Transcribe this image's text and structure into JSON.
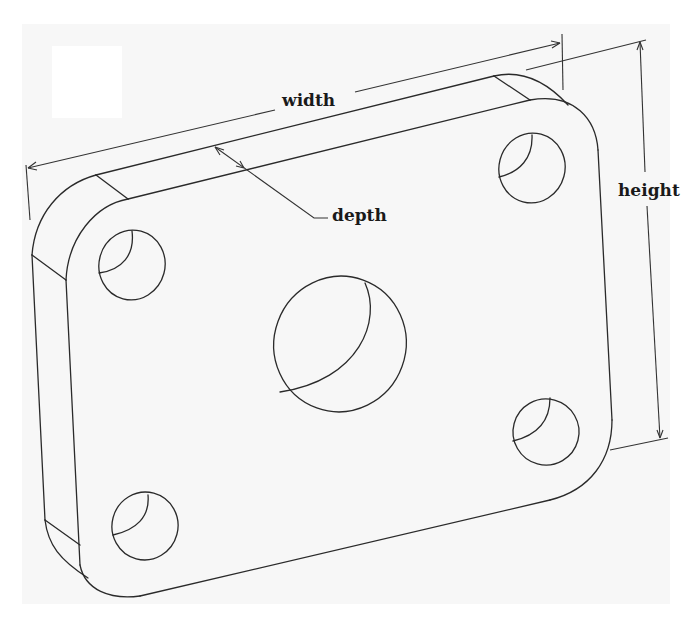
{
  "diagram": {
    "type": "isometric technical drawing",
    "labels": {
      "width": "width",
      "depth": "depth",
      "height": "height"
    },
    "features": {
      "corner_holes": 4,
      "center_holes": 1,
      "dimensions": [
        "width",
        "depth",
        "height"
      ]
    },
    "colors": {
      "line": "#2a2a2a",
      "paper": "#f7f7f7",
      "background": "#ffffff",
      "text": "#1a1a1a"
    }
  }
}
